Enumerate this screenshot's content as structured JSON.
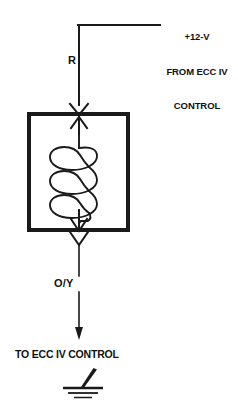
{
  "diagram": {
    "type": "automotive-wiring-schematic",
    "colors": {
      "line": "#1a1a1a",
      "background": "#ffffff",
      "text": "#111111"
    },
    "labels": {
      "supply_line_1": "+12-V",
      "supply_line_2": "FROM ECC IV",
      "supply_line_3": "CONTROL",
      "wire_in": "R",
      "wire_out": "O/Y",
      "destination": "TO ECC IV CONTROL"
    },
    "components": [
      {
        "name": "solenoid-coil",
        "symbol": "helical coil inside rectangle",
        "turns": 3
      },
      {
        "name": "ground",
        "symbol": "earth ground, 3 bars"
      }
    ],
    "connectors": [
      {
        "name": "input-connector",
        "symbol": "chevron-arrow-pair",
        "position": "top of component box"
      },
      {
        "name": "output-connector",
        "symbol": "chevron-arrow-pair",
        "position": "bottom of component box"
      }
    ]
  }
}
